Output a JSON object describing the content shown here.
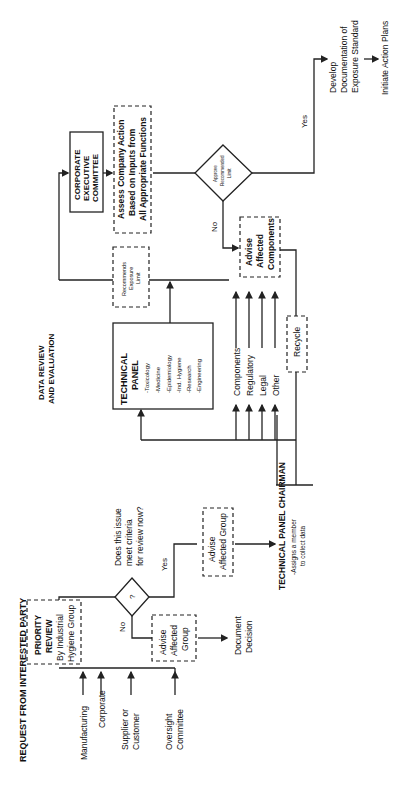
{
  "diagram": {
    "orientation": "rotated 90 degrees counter-clockwise",
    "sections": {
      "request": "REQUEST FROM INTERESTED PARTY",
      "review": "DATA REVIEW AND EVALUATION"
    },
    "sources": [
      "Manufacturing",
      "Corporate",
      "Supplier or Customer",
      "Oversight Committee"
    ],
    "priority_review": [
      "PRIORITY",
      "REVIEW",
      "By Industrial",
      "Hygiene Group"
    ],
    "decision1": {
      "symbol": "?",
      "question": [
        "Does this issue",
        "meet criteria",
        "for review now?"
      ],
      "no": "No",
      "yes": "Yes"
    },
    "advise_no": [
      "Advise",
      "Affected",
      "Group"
    ],
    "document_decision": [
      "Document",
      "Decision"
    ],
    "advise_yes": [
      "Advise",
      "Affected Group"
    ],
    "chairman": {
      "title": "TECHNICAL PANEL CHAIRMAN",
      "note": [
        "-Assigns a member",
        "to collect data"
      ]
    },
    "technical_panel": {
      "title": [
        "TECHNICAL",
        "PANEL"
      ],
      "members": [
        "-Toxicology",
        "-Medicine",
        "-Epidemiology",
        "-Ind. Hygiene",
        "-Research",
        "-Engineering"
      ]
    },
    "inputs": [
      "Components",
      "Regulatory",
      "Legal",
      "Other"
    ],
    "recycle": "Recycle",
    "recommend": [
      "Recommends",
      "Exposure",
      "Limit"
    ],
    "executive": [
      "CORPORATE",
      "EXECUTIVE",
      "COMMITTEE"
    ],
    "assess": [
      "Assess Company Action",
      "Based on Inputs from",
      "All Appropriate Functions"
    ],
    "decision2": {
      "text": [
        "Approve",
        "Recommended",
        "Limit"
      ],
      "no": "No",
      "yes": "Yes"
    },
    "advise_components": [
      "Advise",
      "Affected",
      "Components"
    ],
    "develop": [
      "Develop",
      "Documentation of",
      "Exposure Standard"
    ],
    "initiate": "Initiate Action Plans"
  }
}
